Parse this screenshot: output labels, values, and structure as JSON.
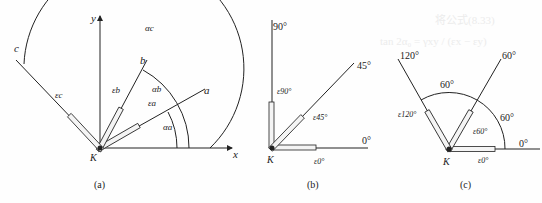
{
  "background_text": {
    "line1": "将公式(8.33)",
    "line2": "tan 2α₀ = γxy / (εx − εy)"
  },
  "panels": [
    {
      "id": "a",
      "caption": "(a)",
      "origin_label": "K",
      "x_axis_label": "x",
      "y_axis_label": "y",
      "rays": [
        {
          "name": "a",
          "gauge": "εa",
          "angle_label": "αa"
        },
        {
          "name": "b",
          "gauge": "εb",
          "angle_label": "αb"
        },
        {
          "name": "c",
          "gauge": "εc",
          "angle_label": "αc"
        }
      ]
    },
    {
      "id": "b",
      "caption": "(b)",
      "origin_label": "K",
      "rays": [
        {
          "angle": "90°",
          "gauge": "ε90°"
        },
        {
          "angle": "45°",
          "gauge": "ε45°"
        },
        {
          "angle": "0°",
          "gauge": "ε0°"
        }
      ]
    },
    {
      "id": "c",
      "caption": "(c)",
      "origin_label": "K",
      "rays": [
        {
          "angle": "120°",
          "gauge": "ε120°"
        },
        {
          "angle": "60°",
          "gauge": "ε60°"
        },
        {
          "angle": "0°",
          "gauge": "ε0°"
        }
      ],
      "arc_labels": [
        "60°",
        "60°"
      ]
    }
  ]
}
